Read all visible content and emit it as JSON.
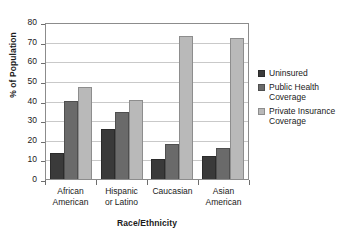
{
  "chart_data": {
    "type": "bar",
    "title": "",
    "subtitle": "",
    "xlabel": "Race/Ethnicity",
    "ylabel": "% of Population",
    "categories": [
      "African\nAmerican",
      "Hispanic\nor Latino",
      "Caucasian",
      "Asian\nAmerican"
    ],
    "series": [
      {
        "name": "Uninsured",
        "values": [
          13.5,
          25.5,
          10.0,
          11.5
        ]
      },
      {
        "name": "Public Health\nCoverage",
        "values": [
          40.0,
          34.0,
          18.0,
          16.0
        ]
      },
      {
        "name": "Private Insurance\nCoverage",
        "values": [
          47.0,
          40.5,
          73.0,
          72.0
        ]
      }
    ],
    "ylim": [
      0,
      80
    ],
    "ytick_values": [
      0,
      10,
      20,
      30,
      40,
      50,
      60,
      70,
      80
    ],
    "ytick_labels": [
      "0",
      "10",
      "20",
      "30",
      "40",
      "50",
      "60",
      "70",
      "80"
    ],
    "grid": true,
    "legend_position": "right",
    "colors": [
      "#3a3a3a",
      "#6a6a6a",
      "#b9b9b9"
    ],
    "plot_border_color": "#8c8c8c",
    "gridline_color": "#c9c9c9",
    "axis_color": "#6e6e6e",
    "background": "#ffffff"
  }
}
